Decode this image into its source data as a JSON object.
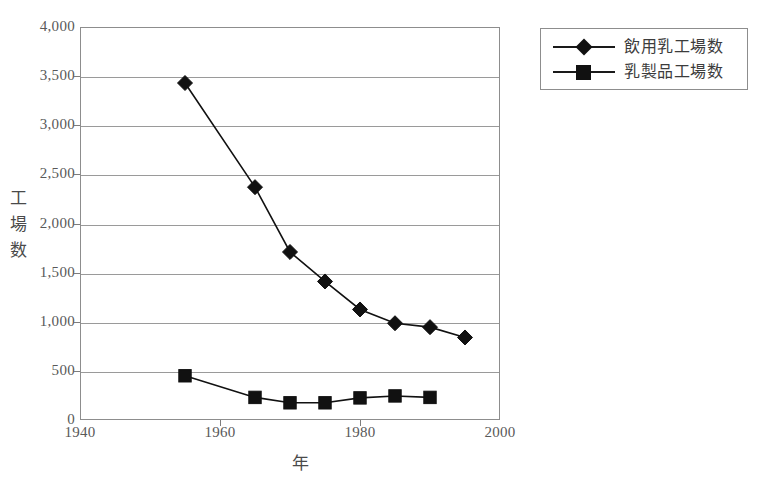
{
  "chart_data": {
    "type": "line",
    "title": "",
    "xlabel": "年",
    "ylabel": "工場数",
    "xlim": [
      1940,
      2000
    ],
    "ylim": [
      0,
      4000
    ],
    "grid": true,
    "legend_position": "top-right",
    "x_ticks": [
      "1940",
      "1960",
      "1980",
      "2000"
    ],
    "x_tick_values": [
      1940,
      1960,
      1980,
      2000
    ],
    "y_ticks": [
      "0",
      "500",
      "1,000",
      "1,500",
      "2,000",
      "2,500",
      "3,000",
      "3,500",
      "4,000"
    ],
    "y_tick_values": [
      0,
      500,
      1000,
      1500,
      2000,
      2500,
      3000,
      3500,
      4000
    ],
    "series": [
      {
        "name": "飲用乳工場数",
        "marker": "diamond",
        "color": "#111111",
        "x": [
          1955,
          1965,
          1970,
          1975,
          1980,
          1985,
          1990,
          1995
        ],
        "values": [
          3430,
          2370,
          1710,
          1410,
          1125,
          985,
          945,
          840
        ]
      },
      {
        "name": "乳製品工場数",
        "marker": "square",
        "color": "#111111",
        "x": [
          1955,
          1965,
          1970,
          1975,
          1980,
          1985,
          1990
        ],
        "values": [
          450,
          230,
          175,
          175,
          225,
          245,
          230
        ]
      }
    ]
  },
  "legend": {
    "items": [
      {
        "label": "飲用乳工場数",
        "marker": "diamond"
      },
      {
        "label": "乳製品工場数",
        "marker": "square"
      }
    ]
  },
  "axes": {
    "y_label_chars": [
      "工",
      "場",
      "数"
    ],
    "x_label": "年"
  }
}
